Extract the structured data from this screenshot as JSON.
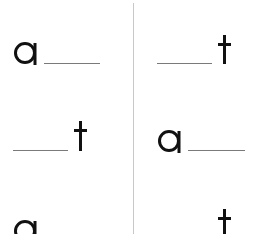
{
  "worksheet": {
    "columns": [
      {
        "side": "left",
        "rows": [
          {
            "letter": "a",
            "blank_position": "after",
            "answer_blank": "___"
          },
          {
            "letter": "t",
            "blank_position": "before",
            "answer_blank": "___"
          },
          {
            "letter": "a",
            "blank_position": "after",
            "answer_blank": "___"
          }
        ]
      },
      {
        "side": "right",
        "rows": [
          {
            "letter": "t",
            "blank_position": "before",
            "answer_blank": "___"
          },
          {
            "letter": "a",
            "blank_position": "after",
            "answer_blank": "___"
          },
          {
            "letter": "t",
            "blank_position": "before",
            "answer_blank": "___"
          }
        ]
      }
    ],
    "colors": {
      "letter": "#111111",
      "blank_line": "#7a7a7a",
      "divider": "#c8c8c8",
      "background": "#ffffff"
    }
  }
}
